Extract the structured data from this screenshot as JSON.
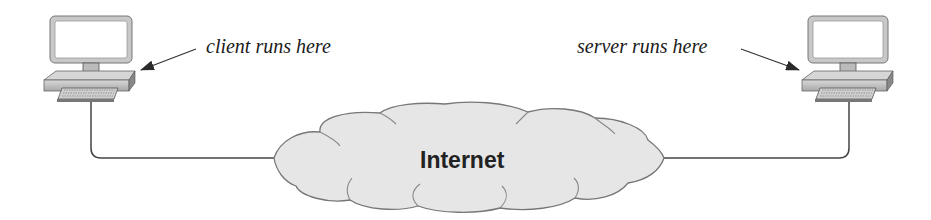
{
  "diagram": {
    "client": {
      "label": "client runs here",
      "icon": "desktop-computer-icon"
    },
    "server": {
      "label": "server runs here",
      "icon": "desktop-computer-icon"
    },
    "network": {
      "label": "Internet",
      "icon": "cloud-icon"
    }
  },
  "colors": {
    "outline": "#555555",
    "cloud_fill": "#e8e8e8",
    "monitor_fill": "#c9c9c9",
    "screen_fill": "#ffffff",
    "line": "#444444",
    "text": "#1a1a1a"
  }
}
